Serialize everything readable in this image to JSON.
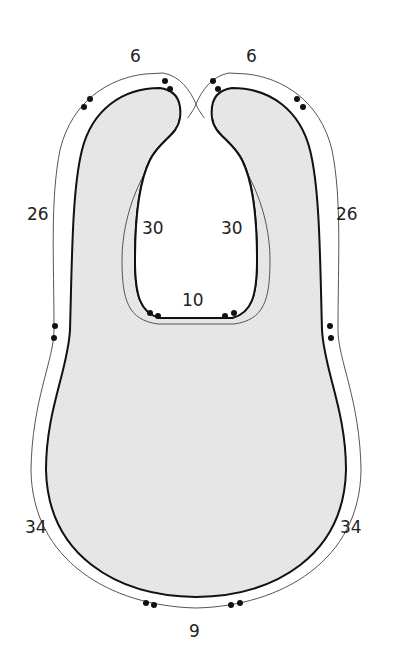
{
  "diagram": {
    "colors": {
      "fill": "#e6e6e6",
      "outline": "#111111",
      "seam_line": "#555555",
      "background": "#ffffff"
    },
    "labels": {
      "top_left": "6",
      "top_right": "6",
      "outer_left": "26",
      "outer_right": "26",
      "inner_left": "30",
      "inner_right": "30",
      "neck_bottom": "10",
      "lower_left": "34",
      "lower_right": "34",
      "bottom": "9"
    }
  }
}
